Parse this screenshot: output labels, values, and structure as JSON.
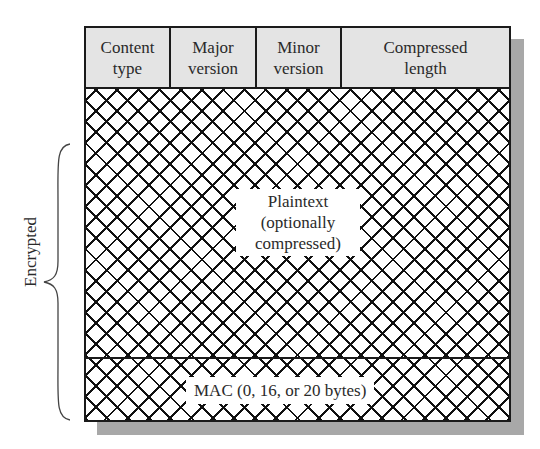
{
  "diagram": {
    "type": "record-format",
    "header_fields": [
      {
        "line1": "Content",
        "line2": "type"
      },
      {
        "line1": "Major",
        "line2": "version"
      },
      {
        "line1": "Minor",
        "line2": "version"
      },
      {
        "line1": "Compressed",
        "line2": "length"
      }
    ],
    "payload": {
      "line1": "Plaintext",
      "line2": "(optionally",
      "line3": "compressed)"
    },
    "mac": {
      "label": "MAC (0, 16, or 20 bytes)"
    },
    "brace_label": "Encrypted",
    "colors": {
      "header_fill": "#e4e4e4",
      "line": "#1a1a1a",
      "shadow": "#a8a8a8",
      "hatch": "#111111"
    }
  }
}
